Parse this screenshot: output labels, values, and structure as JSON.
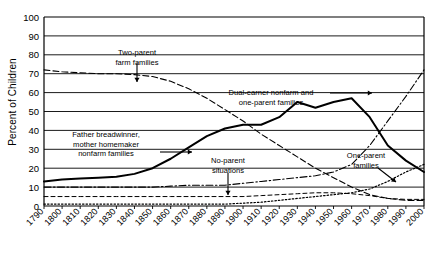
{
  "chart_data": {
    "type": "line",
    "title": "",
    "subtitle": "",
    "xlabel": "",
    "ylabel": "Percent of Children",
    "xlim": [
      1790,
      2000
    ],
    "ylim": [
      0,
      100
    ],
    "grid": true,
    "grid_axis": "y",
    "legend": "none",
    "ytick_step": 10,
    "yticks": [
      0,
      10,
      20,
      30,
      40,
      50,
      60,
      70,
      80,
      90,
      100
    ],
    "xticks": [
      1790,
      1800,
      1810,
      1820,
      1830,
      1840,
      1850,
      1860,
      1870,
      1880,
      1890,
      1900,
      1910,
      1920,
      1930,
      1940,
      1950,
      1960,
      1970,
      1980,
      1990,
      2000
    ],
    "xtick_labels": [
      "1790",
      "1800",
      "1810",
      "1820",
      "1830",
      "1840",
      "1850",
      "1860",
      "1870",
      "1880",
      "1890",
      "1900",
      "1910",
      "1920",
      "1930",
      "1940",
      "1950",
      "1960",
      "1970",
      "1980",
      "1990",
      "2000"
    ],
    "xtick_rotation": 45,
    "x": [
      1790,
      1800,
      1810,
      1820,
      1830,
      1840,
      1850,
      1860,
      1870,
      1880,
      1890,
      1900,
      1910,
      1920,
      1930,
      1940,
      1950,
      1960,
      1970,
      1980,
      1990,
      2000
    ],
    "series": [
      {
        "name": "Two-parent farm families",
        "style": "dashed",
        "color": "#000000",
        "values": [
          72,
          71,
          70.5,
          70,
          70,
          69.5,
          68.5,
          66,
          62,
          57,
          51,
          45,
          38,
          32,
          26,
          20,
          15,
          10,
          6,
          4,
          3,
          3
        ]
      },
      {
        "name": "Father breadwinner, mother homemaker nonfarm families",
        "style": "solid",
        "color": "#000000",
        "values": [
          13,
          14,
          14.5,
          15,
          15.5,
          17,
          20,
          25,
          31,
          37,
          41,
          43,
          43,
          47,
          55,
          52,
          55,
          57,
          47,
          32,
          24,
          18
        ]
      },
      {
        "name": "Dual-earner nonfarm and one-parent families",
        "style": "dash-dot",
        "color": "#000000",
        "values": [
          10,
          10,
          10,
          10,
          10,
          10,
          10,
          10.5,
          11,
          11,
          11,
          12,
          13,
          14,
          15,
          16,
          18,
          22,
          32,
          45,
          58,
          72
        ]
      },
      {
        "name": "One-parent families",
        "style": "dotted",
        "color": "#000000",
        "values": [
          1,
          1,
          1,
          1,
          1,
          1,
          1,
          1,
          1,
          1,
          1,
          1.5,
          2,
          3,
          4,
          5,
          6,
          7,
          9,
          13,
          18,
          22
        ]
      },
      {
        "name": "No-parent situations",
        "style": "dashed-fine",
        "color": "#000000",
        "values": [
          5,
          5,
          5,
          5,
          5,
          5,
          5,
          5,
          5,
          5,
          5,
          5,
          5.5,
          6,
          6.5,
          7,
          7,
          6.5,
          5.5,
          4,
          3.5,
          3.5
        ]
      }
    ],
    "annotations": [
      {
        "text_line1": "Two-parent",
        "text_line2": "farm families",
        "arrow": "down"
      },
      {
        "text_line1": "Dual-earner nonfarm and",
        "text_line2": "one-parent families",
        "arrow": "right"
      },
      {
        "text_line1": "Father breadwinner,",
        "text_line2": "mother homemaker",
        "text_line3": "nonfarm families",
        "arrow": "right"
      },
      {
        "text_line1": "No-parent",
        "text_line2": "situations",
        "arrow": "down"
      },
      {
        "text_line1": "One-parent",
        "text_line2": "families",
        "arrow": "down-right"
      }
    ]
  },
  "axis": {
    "y_title": "Percent of Children"
  },
  "annotation_text": {
    "two_parent_1": "Two-parent",
    "two_parent_2": "farm families",
    "dual_earner_1": "Dual-earner nonfarm and",
    "dual_earner_2": "one-parent families",
    "father_bread_1": "Father breadwinner,",
    "father_bread_2": "mother homemaker",
    "father_bread_3": "nonfarm families",
    "no_parent_1": "No-parent",
    "no_parent_2": "situations",
    "one_parent_1": "One-parent",
    "one_parent_2": "families"
  }
}
